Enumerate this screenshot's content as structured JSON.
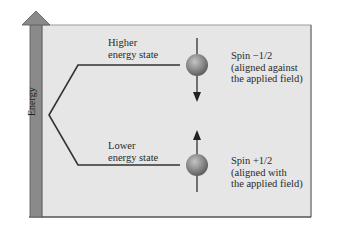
{
  "diagram": {
    "axis": {
      "label": "Energy",
      "direction": "up"
    },
    "levels": {
      "higher": {
        "label_line1": "Higher",
        "label_line2": "energy state"
      },
      "lower": {
        "label_line1": "Lower",
        "label_line2": "energy state"
      }
    },
    "spins": {
      "minus": {
        "title": "Spin −1/2",
        "line2": "(aligned against",
        "line3": "the applied field)",
        "arrow": "down"
      },
      "plus": {
        "title": "Spin +1/2",
        "line2": "(aligned with",
        "line3": "the applied field)",
        "arrow": "up"
      }
    },
    "colors": {
      "panel": "#e6e6e6",
      "axis_bar": "#8a8a8a",
      "line": "#333333",
      "sphere": "#8e8e8e"
    }
  }
}
